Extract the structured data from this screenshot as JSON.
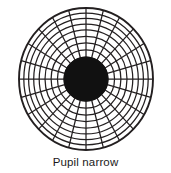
{
  "figure": {
    "caption": "Pupil narrow",
    "title": "Pupil narrow"
  },
  "colors": {
    "background": "#ffffff",
    "grid_line": "#231f20",
    "pupil_fill": "#111111",
    "outline": "#231f20",
    "caption_text": "#1a1a1a"
  },
  "diagram": {
    "type": "polar-grid",
    "center_x": 86,
    "center_y": 79,
    "outer_radius_x": 67,
    "outer_radius_y": 71,
    "pupil_radius_x": 22,
    "pupil_radius_y": 22,
    "spoke_count": 24,
    "ring_count": 8,
    "ring_radii_fraction": [
      0.3283,
      0.4261,
      0.5209,
      0.6119,
      0.6985,
      0.7806,
      0.8567,
      0.9284,
      1.0
    ],
    "stroke_width_grid": 1.25,
    "stroke_width_outline": 1.9,
    "labels": {
      "pupil": "Pupil",
      "state": "narrow"
    }
  }
}
